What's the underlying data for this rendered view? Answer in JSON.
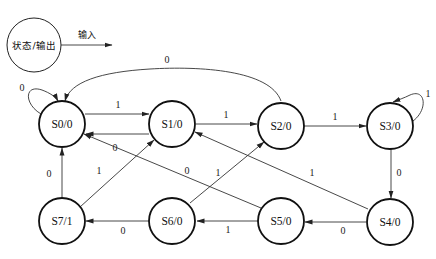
{
  "legend": {
    "node_label": "状态/输出",
    "arrow_label": "输入"
  },
  "states": [
    {
      "id": "S0",
      "label": "S0/0",
      "output": 0
    },
    {
      "id": "S1",
      "label": "S1/0",
      "output": 0
    },
    {
      "id": "S2",
      "label": "S2/0",
      "output": 0
    },
    {
      "id": "S3",
      "label": "S3/0",
      "output": 0
    },
    {
      "id": "S4",
      "label": "S4/0",
      "output": 0
    },
    {
      "id": "S5",
      "label": "S5/0",
      "output": 0
    },
    {
      "id": "S6",
      "label": "S6/0",
      "output": 0
    },
    {
      "id": "S7",
      "label": "S7/1",
      "output": 1
    }
  ],
  "transitions": [
    {
      "from": "S0",
      "to": "S0",
      "input": "0"
    },
    {
      "from": "S0",
      "to": "S1",
      "input": "1"
    },
    {
      "from": "S1",
      "to": "S0",
      "input": "0"
    },
    {
      "from": "S1",
      "to": "S2",
      "input": "1"
    },
    {
      "from": "S2",
      "to": "S0",
      "input": "0"
    },
    {
      "from": "S2",
      "to": "S3",
      "input": "1"
    },
    {
      "from": "S3",
      "to": "S3",
      "input": "1"
    },
    {
      "from": "S3",
      "to": "S4",
      "input": "0"
    },
    {
      "from": "S4",
      "to": "S5",
      "input": "0"
    },
    {
      "from": "S4",
      "to": "S1",
      "input": "1"
    },
    {
      "from": "S5",
      "to": "S6",
      "input": "1"
    },
    {
      "from": "S5",
      "to": "S0",
      "input": "0"
    },
    {
      "from": "S6",
      "to": "S7",
      "input": "0"
    },
    {
      "from": "S6",
      "to": "S2",
      "input": "1"
    },
    {
      "from": "S7",
      "to": "S0",
      "input": "0"
    },
    {
      "from": "S7",
      "to": "S1",
      "input": "1"
    }
  ]
}
